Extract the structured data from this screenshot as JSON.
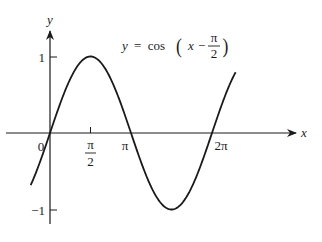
{
  "chart_data": {
    "type": "line",
    "title_parts": {
      "lhs": "y",
      "eq": "=",
      "func": "cos",
      "x": "x",
      "minus": "−",
      "num": "π",
      "den": "2"
    },
    "xlabel": "x",
    "ylabel": "y",
    "x_ticks": [
      {
        "value": 0,
        "label": "0"
      },
      {
        "value": 1.5708,
        "label_num": "π",
        "label_den": "2"
      },
      {
        "value": 3.1416,
        "label": "π"
      },
      {
        "value": 6.2832,
        "label": "2π"
      }
    ],
    "y_ticks": [
      {
        "value": 1,
        "label": "1"
      },
      {
        "value": -1,
        "label": "−1"
      }
    ],
    "xlim": [
      -0.75,
      7.3
    ],
    "ylim": [
      -1.0,
      1.0
    ],
    "grid": false,
    "legend": null,
    "series": [
      {
        "name": "y = cos(x − π/2)",
        "function": "cos(x - pi/2)",
        "x_range": [
          -0.75,
          7.2
        ],
        "points": [
          {
            "x": -0.75,
            "y": -0.68
          },
          {
            "x": 0,
            "y": 0
          },
          {
            "x": 1.5708,
            "y": 1
          },
          {
            "x": 3.1416,
            "y": 0
          },
          {
            "x": 4.7124,
            "y": -1
          },
          {
            "x": 6.2832,
            "y": 0
          },
          {
            "x": 7.854,
            "y": 1
          }
        ]
      }
    ],
    "color": "#1a1a1a"
  }
}
